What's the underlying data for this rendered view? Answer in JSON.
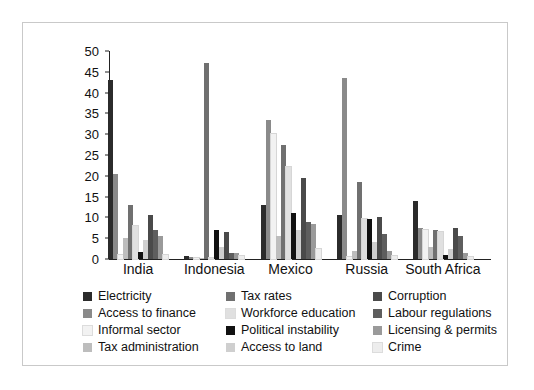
{
  "chart_data": {
    "type": "bar",
    "title": "",
    "xlabel": "",
    "ylabel": "",
    "ylim": [
      0,
      50
    ],
    "yticks": [
      0,
      5,
      10,
      15,
      20,
      25,
      30,
      35,
      40,
      45,
      50
    ],
    "grid": false,
    "legend_position": "bottom",
    "legend_columns": 3,
    "categories": [
      "India",
      "Indonesia",
      "Mexico",
      "Russia",
      "South Africa"
    ],
    "series": [
      {
        "name": "Electricity",
        "color": "#2b2b2b",
        "values": [
          43.0,
          0.8,
          13.0,
          10.5,
          14.0
        ]
      },
      {
        "name": "Access to finance",
        "color": "#8a8a8a",
        "values": [
          20.5,
          0.5,
          33.5,
          43.5,
          7.5
        ]
      },
      {
        "name": "Informal sector",
        "color": "#f2f2f2",
        "values": [
          1.0,
          0.3,
          30.0,
          0.5,
          7.0
        ]
      },
      {
        "name": "Tax administration",
        "color": "#bdbdbd",
        "values": [
          5.0,
          0.2,
          5.5,
          2.0,
          3.0
        ]
      },
      {
        "name": "Tax rates",
        "color": "#707070",
        "values": [
          13.0,
          47.0,
          27.5,
          18.5,
          7.0
        ]
      },
      {
        "name": "Workforce education",
        "color": "#e0e0e0",
        "values": [
          8.0,
          0.3,
          22.0,
          9.5,
          6.5
        ]
      },
      {
        "name": "Political instability",
        "color": "#111111",
        "values": [
          1.7,
          7.0,
          11.0,
          9.5,
          1.0
        ]
      },
      {
        "name": "Access to land",
        "color": "#cfcfcf",
        "values": [
          4.5,
          3.0,
          7.0,
          4.0,
          2.5
        ]
      },
      {
        "name": "Corruption",
        "color": "#4a4a4a",
        "values": [
          10.5,
          6.5,
          19.5,
          10.0,
          7.5
        ]
      },
      {
        "name": "Labour regulations",
        "color": "#5e5e5e",
        "values": [
          7.0,
          1.5,
          9.0,
          6.0,
          5.5
        ]
      },
      {
        "name": "Licensing & permits",
        "color": "#9a9a9a",
        "values": [
          5.5,
          1.5,
          8.5,
          2.0,
          1.5
        ]
      },
      {
        "name": "Crime",
        "color": "#ededed",
        "values": [
          1.0,
          0.8,
          2.5,
          0.8,
          0.5
        ]
      }
    ]
  },
  "legend": {
    "columns": [
      [
        {
          "label": "Electricity",
          "color": "#2b2b2b"
        },
        {
          "label": "Access to finance",
          "color": "#8a8a8a"
        },
        {
          "label": "Informal sector",
          "color": "#f2f2f2"
        },
        {
          "label": "Tax administration",
          "color": "#bdbdbd"
        }
      ],
      [
        {
          "label": "Tax rates",
          "color": "#707070"
        },
        {
          "label": "Workforce education",
          "color": "#e0e0e0"
        },
        {
          "label": "Political instability",
          "color": "#111111"
        },
        {
          "label": "Access to land",
          "color": "#cfcfcf"
        }
      ],
      [
        {
          "label": "Corruption",
          "color": "#4a4a4a"
        },
        {
          "label": "Labour regulations",
          "color": "#5e5e5e"
        },
        {
          "label": "Licensing & permits",
          "color": "#9a9a9a"
        },
        {
          "label": "Crime",
          "color": "#ededed"
        }
      ]
    ]
  }
}
